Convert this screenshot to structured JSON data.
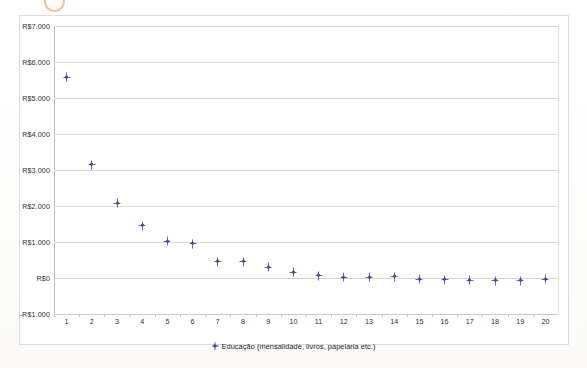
{
  "chart_data": {
    "type": "scatter",
    "title": "",
    "xlabel": "",
    "ylabel": "",
    "grid": true,
    "legend_position": "bottom",
    "categories": [
      "1",
      "2",
      "3",
      "4",
      "5",
      "6",
      "7",
      "8",
      "9",
      "10",
      "11",
      "12",
      "13",
      "14",
      "15",
      "16",
      "17",
      "18",
      "19",
      "20"
    ],
    "x": [
      1,
      2,
      3,
      4,
      5,
      6,
      7,
      8,
      9,
      10,
      11,
      12,
      13,
      14,
      15,
      16,
      17,
      18,
      19,
      20
    ],
    "ylim": [
      -1000,
      7000
    ],
    "ytick_values": [
      7000,
      6000,
      5000,
      4000,
      3000,
      2000,
      1000,
      0,
      -1000
    ],
    "ytick_labels": [
      "R$7.000",
      "R$6.000",
      "R$5.000",
      "R$4.000",
      "R$3.000",
      "R$2.000",
      "R$1.000",
      "R$0",
      "-R$1.000"
    ],
    "xtick_labels": [
      "1",
      "2",
      "3",
      "4",
      "5",
      "6",
      "7",
      "8",
      "9",
      "10",
      "11",
      "12",
      "13",
      "14",
      "15",
      "16",
      "17",
      "18",
      "19",
      "20"
    ],
    "series": [
      {
        "name": "Educação (mensalidade, livros, papelaria etc.)",
        "color": "#3d4f8f",
        "marker": "diamond-plus",
        "values": [
          5580,
          3150,
          2080,
          1450,
          1020,
          950,
          450,
          450,
          300,
          160,
          60,
          20,
          20,
          30,
          -40,
          -50,
          -60,
          -70,
          -80,
          -40
        ]
      }
    ],
    "annotations": []
  },
  "legend": {
    "entries": [
      {
        "label": "Educação (mensalidade, livros, papelaria etc.)",
        "marker_name": "series-marker-educacao"
      }
    ]
  },
  "colors": {
    "marker": "#3d4f8f",
    "marker_cross": "#5b6aa5",
    "gridline": "#dedbd4",
    "frame": "#dcdcdc",
    "axis": "#b9b9b9",
    "text": "#2f2f2f",
    "artifact": "#e8a87c"
  }
}
